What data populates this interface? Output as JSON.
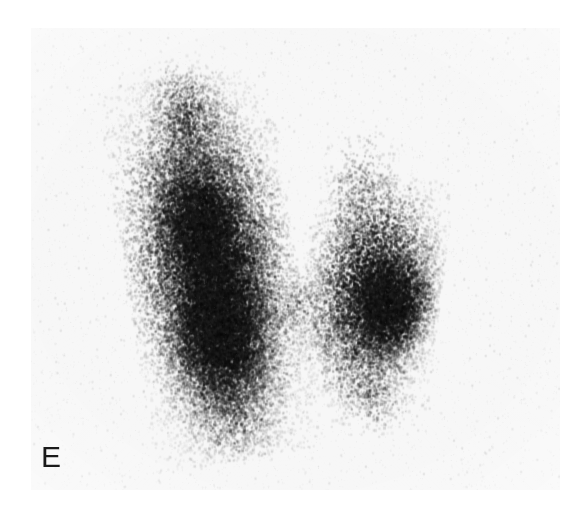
{
  "figure": {
    "panel_label": "E",
    "modality": "thyroid-scintigram",
    "background_color": "#ffffff",
    "field_background_color": "#f7f7f7",
    "uptake_color": "#0d0d0d",
    "field": {
      "x": 31,
      "y": 28,
      "width": 529,
      "height": 462
    }
  },
  "scan_data": {
    "type": "scatter",
    "title": "",
    "xlabel": "",
    "ylabel": "",
    "rendering": "dot-density gamma camera scintigram",
    "grayscale": {
      "min": "#0a0a0a",
      "max": "#fafafa"
    },
    "regions": [
      {
        "name": "left-lobe",
        "label": "right thyroid lobe (image left)",
        "center_x": 0.34,
        "center_y": 0.52,
        "radius_x": 0.155,
        "radius_y": 0.4,
        "intensity": 1.0,
        "tilt_deg": -9
      },
      {
        "name": "left-lobe-hot-core",
        "label": "dense uptake focus, lower left lobe",
        "center_x": 0.36,
        "center_y": 0.66,
        "radius_x": 0.105,
        "radius_y": 0.18,
        "intensity": 1.25,
        "tilt_deg": -6
      },
      {
        "name": "left-lobe-upper-core",
        "label": "dense uptake focus, mid-upper left lobe",
        "center_x": 0.325,
        "center_y": 0.43,
        "radius_x": 0.095,
        "radius_y": 0.17,
        "intensity": 1.1,
        "tilt_deg": -12
      },
      {
        "name": "left-lobe-superior-pole",
        "label": "superior pole, left lobe",
        "center_x": 0.295,
        "center_y": 0.2,
        "radius_x": 0.075,
        "radius_y": 0.13,
        "intensity": 0.6,
        "tilt_deg": -14
      },
      {
        "name": "left-lobe-inferior-pole",
        "label": "inferior pole, left lobe",
        "center_x": 0.385,
        "center_y": 0.83,
        "radius_x": 0.095,
        "radius_y": 0.11,
        "intensity": 0.5,
        "tilt_deg": 0
      },
      {
        "name": "isthmus",
        "label": "isthmus, reduced uptake",
        "center_x": 0.5,
        "center_y": 0.6,
        "radius_x": 0.075,
        "radius_y": 0.095,
        "intensity": 0.42,
        "tilt_deg": 0
      },
      {
        "name": "right-lobe",
        "label": "left thyroid lobe (image right)",
        "center_x": 0.645,
        "center_y": 0.57,
        "radius_x": 0.125,
        "radius_y": 0.245,
        "intensity": 0.95,
        "tilt_deg": 7
      },
      {
        "name": "right-lobe-hot-core",
        "label": "dense uptake focus, right lobe",
        "center_x": 0.682,
        "center_y": 0.6,
        "radius_x": 0.082,
        "radius_y": 0.125,
        "intensity": 1.22,
        "tilt_deg": 10
      },
      {
        "name": "right-lobe-superior-pole",
        "label": "superior pole, right lobe",
        "center_x": 0.625,
        "center_y": 0.35,
        "radius_x": 0.07,
        "radius_y": 0.125,
        "intensity": 0.4,
        "tilt_deg": 4
      },
      {
        "name": "right-lobe-inferior-pole",
        "label": "inferior pole, right lobe",
        "center_x": 0.645,
        "center_y": 0.79,
        "radius_x": 0.075,
        "radius_y": 0.09,
        "intensity": 0.45,
        "tilt_deg": 0
      }
    ],
    "background_noise_level": 0.035,
    "dot_count": 52000
  }
}
